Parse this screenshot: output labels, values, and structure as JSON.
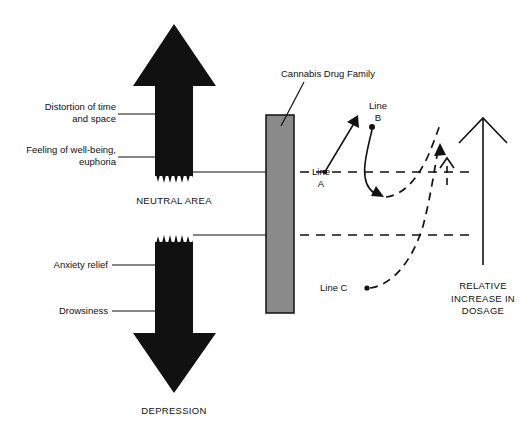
{
  "diagram": {
    "title_caption_top": "NEUTRAL AREA",
    "title_caption_bottom": "DEPRESSION",
    "stimulant_arrow": {
      "name": "up-arrow",
      "direction": "up",
      "color": "#111111"
    },
    "depressant_arrow": {
      "name": "down-arrow",
      "direction": "down",
      "color": "#111111"
    },
    "effect_labels": [
      {
        "text": "Distortion of time\nand space",
        "side": "left"
      },
      {
        "text": "Feeling of well-being,\neuphoria",
        "side": "left"
      },
      {
        "text": "Anxiety relief",
        "side": "left"
      },
      {
        "text": "Drowsiness",
        "side": "left"
      }
    ],
    "drug_bar": {
      "label": "Cannabis Drug Family",
      "fill": "#8a8a8a",
      "stroke": "#111111"
    },
    "curve_labels": [
      {
        "text": "Line\nA",
        "id": "line-a"
      },
      {
        "text": "Line\nB",
        "id": "line-b"
      },
      {
        "text": "Line C",
        "id": "line-c"
      }
    ],
    "axis_label": "RELATIVE\nINCREASE IN\nDOSAGE"
  }
}
